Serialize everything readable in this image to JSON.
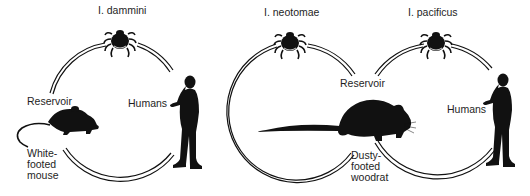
{
  "diagram": {
    "cycles": [
      {
        "vector": "I. dammini",
        "reservoir_label": "Reservoir",
        "reservoir_host": "White-\nfooted\nmouse",
        "incidental_host": "Humans"
      },
      {
        "vector": "I. neotomae",
        "reservoir_label": "Reservoir",
        "reservoir_host": "Dusty-\nfooted\nwoodrat"
      },
      {
        "vector": "I. pacificus",
        "incidental_host": "Humans"
      }
    ],
    "colors": {
      "ink": "#111111",
      "background": "#ffffff"
    }
  }
}
